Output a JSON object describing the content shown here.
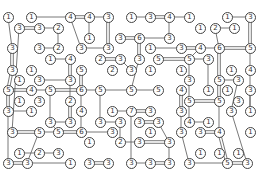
{
  "game": {
    "title": "Hashi (Bridges) puzzle",
    "colors": {
      "background": "#ffffff",
      "bridge": "#555555",
      "island_border": "#444444",
      "text": "#333333"
    },
    "islands": [
      {
        "id": "a1",
        "x": 8,
        "y": 17,
        "n": 1
      },
      {
        "id": "a2",
        "x": 31,
        "y": 17,
        "n": 1
      },
      {
        "id": "a3",
        "x": 70,
        "y": 17,
        "n": 4
      },
      {
        "id": "a4",
        "x": 89,
        "y": 17,
        "n": 4
      },
      {
        "id": "a5",
        "x": 108,
        "y": 17,
        "n": 3
      },
      {
        "id": "a6",
        "x": 131,
        "y": 17,
        "n": 1
      },
      {
        "id": "a7",
        "x": 150,
        "y": 17,
        "n": 3
      },
      {
        "id": "a8",
        "x": 169,
        "y": 17,
        "n": 4
      },
      {
        "id": "a9",
        "x": 189,
        "y": 17,
        "n": 1
      },
      {
        "id": "a10",
        "x": 227,
        "y": 17,
        "n": 1
      },
      {
        "id": "a11",
        "x": 250,
        "y": 17,
        "n": 3
      },
      {
        "id": "b1",
        "x": 19,
        "y": 28,
        "n": 3
      },
      {
        "id": "b2",
        "x": 39,
        "y": 28,
        "n": 3
      },
      {
        "id": "b3",
        "x": 58,
        "y": 28,
        "n": 2
      },
      {
        "id": "b4",
        "x": 200,
        "y": 28,
        "n": 1
      },
      {
        "id": "b5",
        "x": 215,
        "y": 28,
        "n": 2
      },
      {
        "id": "b6",
        "x": 234,
        "y": 28,
        "n": 1
      },
      {
        "id": "c1",
        "x": 89,
        "y": 38,
        "n": 1
      },
      {
        "id": "c2",
        "x": 120,
        "y": 38,
        "n": 3
      },
      {
        "id": "c3",
        "x": 139,
        "y": 38,
        "n": 6
      },
      {
        "id": "c4",
        "x": 169,
        "y": 38,
        "n": 3
      },
      {
        "id": "d1",
        "x": 12,
        "y": 48,
        "n": 3
      },
      {
        "id": "d2",
        "x": 39,
        "y": 48,
        "n": 3
      },
      {
        "id": "d3",
        "x": 58,
        "y": 48,
        "n": 2
      },
      {
        "id": "d4",
        "x": 81,
        "y": 48,
        "n": 3
      },
      {
        "id": "d5",
        "x": 108,
        "y": 48,
        "n": 3
      },
      {
        "id": "d6",
        "x": 150,
        "y": 48,
        "n": 1
      },
      {
        "id": "d7",
        "x": 181,
        "y": 48,
        "n": 3
      },
      {
        "id": "d8",
        "x": 200,
        "y": 48,
        "n": 4
      },
      {
        "id": "d9",
        "x": 219,
        "y": 48,
        "n": 6
      },
      {
        "id": "d10",
        "x": 250,
        "y": 48,
        "n": 5
      },
      {
        "id": "e1",
        "x": 50,
        "y": 59,
        "n": 1
      },
      {
        "id": "e2",
        "x": 70,
        "y": 59,
        "n": 4
      },
      {
        "id": "e3",
        "x": 100,
        "y": 59,
        "n": 2
      },
      {
        "id": "e4",
        "x": 120,
        "y": 59,
        "n": 3
      },
      {
        "id": "e5",
        "x": 139,
        "y": 59,
        "n": 3
      },
      {
        "id": "e6",
        "x": 158,
        "y": 59,
        "n": 5
      },
      {
        "id": "e7",
        "x": 189,
        "y": 59,
        "n": 5
      },
      {
        "id": "e8",
        "x": 208,
        "y": 59,
        "n": 3
      },
      {
        "id": "f1",
        "x": 12,
        "y": 70,
        "n": 3
      },
      {
        "id": "f2",
        "x": 31,
        "y": 70,
        "n": 1
      },
      {
        "id": "f3",
        "x": 81,
        "y": 70,
        "n": 5
      },
      {
        "id": "f4",
        "x": 112,
        "y": 70,
        "n": 2
      },
      {
        "id": "f5",
        "x": 131,
        "y": 70,
        "n": 3
      },
      {
        "id": "f6",
        "x": 150,
        "y": 70,
        "n": 1
      },
      {
        "id": "f7",
        "x": 181,
        "y": 70,
        "n": 1
      },
      {
        "id": "f8",
        "x": 231,
        "y": 70,
        "n": 1
      },
      {
        "id": "f9",
        "x": 250,
        "y": 70,
        "n": 4
      },
      {
        "id": "g1",
        "x": 19,
        "y": 80,
        "n": 1
      },
      {
        "id": "g2",
        "x": 39,
        "y": 80,
        "n": 3
      },
      {
        "id": "g3",
        "x": 70,
        "y": 80,
        "n": 3
      },
      {
        "id": "g4",
        "x": 189,
        "y": 80,
        "n": 3
      },
      {
        "id": "g5",
        "x": 219,
        "y": 80,
        "n": 5
      },
      {
        "id": "g6",
        "x": 238,
        "y": 80,
        "n": 3
      },
      {
        "id": "h1",
        "x": 8,
        "y": 90,
        "n": 5
      },
      {
        "id": "h2",
        "x": 31,
        "y": 90,
        "n": 4
      },
      {
        "id": "h3",
        "x": 50,
        "y": 90,
        "n": 5
      },
      {
        "id": "h4",
        "x": 81,
        "y": 90,
        "n": 6
      },
      {
        "id": "h5",
        "x": 100,
        "y": 90,
        "n": 5
      },
      {
        "id": "h6",
        "x": 131,
        "y": 90,
        "n": 5
      },
      {
        "id": "h7",
        "x": 158,
        "y": 90,
        "n": 5
      },
      {
        "id": "h8",
        "x": 181,
        "y": 90,
        "n": 4
      },
      {
        "id": "h9",
        "x": 208,
        "y": 90,
        "n": 1
      },
      {
        "id": "h10",
        "x": 227,
        "y": 90,
        "n": 1
      },
      {
        "id": "h11",
        "x": 250,
        "y": 90,
        "n": 3
      },
      {
        "id": "i1",
        "x": 19,
        "y": 101,
        "n": 1
      },
      {
        "id": "i2",
        "x": 39,
        "y": 101,
        "n": 3
      },
      {
        "id": "i3",
        "x": 70,
        "y": 101,
        "n": 2
      },
      {
        "id": "i4",
        "x": 189,
        "y": 101,
        "n": 5
      },
      {
        "id": "i5",
        "x": 219,
        "y": 101,
        "n": 5
      },
      {
        "id": "i6",
        "x": 238,
        "y": 101,
        "n": 3
      },
      {
        "id": "j1",
        "x": 8,
        "y": 111,
        "n": 3
      },
      {
        "id": "j2",
        "x": 31,
        "y": 111,
        "n": 1
      },
      {
        "id": "j3",
        "x": 81,
        "y": 111,
        "n": 4
      },
      {
        "id": "j4",
        "x": 112,
        "y": 111,
        "n": 1
      },
      {
        "id": "j5",
        "x": 131,
        "y": 111,
        "n": 7
      },
      {
        "id": "j6",
        "x": 150,
        "y": 111,
        "n": 3
      },
      {
        "id": "j7",
        "x": 181,
        "y": 111,
        "n": 3
      },
      {
        "id": "j8",
        "x": 231,
        "y": 111,
        "n": 3
      },
      {
        "id": "j9",
        "x": 250,
        "y": 111,
        "n": 1
      },
      {
        "id": "k1",
        "x": 50,
        "y": 122,
        "n": 3
      },
      {
        "id": "k2",
        "x": 70,
        "y": 122,
        "n": 3
      },
      {
        "id": "k3",
        "x": 100,
        "y": 122,
        "n": 3
      },
      {
        "id": "k4",
        "x": 120,
        "y": 122,
        "n": 3
      },
      {
        "id": "k5",
        "x": 139,
        "y": 122,
        "n": 3
      },
      {
        "id": "k6",
        "x": 158,
        "y": 122,
        "n": 3
      },
      {
        "id": "k7",
        "x": 189,
        "y": 122,
        "n": 4
      },
      {
        "id": "k8",
        "x": 208,
        "y": 122,
        "n": 1
      },
      {
        "id": "l1",
        "x": 12,
        "y": 132,
        "n": 3
      },
      {
        "id": "l2",
        "x": 39,
        "y": 132,
        "n": 5
      },
      {
        "id": "l3",
        "x": 58,
        "y": 132,
        "n": 5
      },
      {
        "id": "l4",
        "x": 81,
        "y": 132,
        "n": 6
      },
      {
        "id": "l5",
        "x": 112,
        "y": 132,
        "n": 3
      },
      {
        "id": "l6",
        "x": 150,
        "y": 132,
        "n": 1
      },
      {
        "id": "l7",
        "x": 181,
        "y": 132,
        "n": 3
      },
      {
        "id": "l8",
        "x": 200,
        "y": 132,
        "n": 3
      },
      {
        "id": "l9",
        "x": 219,
        "y": 132,
        "n": 4
      },
      {
        "id": "l10",
        "x": 250,
        "y": 132,
        "n": 1
      },
      {
        "id": "m1",
        "x": 89,
        "y": 142,
        "n": 1
      },
      {
        "id": "m2",
        "x": 120,
        "y": 142,
        "n": 2
      },
      {
        "id": "m3",
        "x": 139,
        "y": 142,
        "n": 3
      },
      {
        "id": "m4",
        "x": 169,
        "y": 142,
        "n": 3
      },
      {
        "id": "n1",
        "x": 19,
        "y": 153,
        "n": 1
      },
      {
        "id": "n2",
        "x": 39,
        "y": 153,
        "n": 2
      },
      {
        "id": "n3",
        "x": 58,
        "y": 153,
        "n": 3
      },
      {
        "id": "n4",
        "x": 200,
        "y": 153,
        "n": 1
      },
      {
        "id": "n5",
        "x": 219,
        "y": 153,
        "n": 1
      },
      {
        "id": "n6",
        "x": 238,
        "y": 153,
        "n": 1
      },
      {
        "id": "o1",
        "x": 8,
        "y": 163,
        "n": 3
      },
      {
        "id": "o2",
        "x": 27,
        "y": 163,
        "n": 3
      },
      {
        "id": "o3",
        "x": 70,
        "y": 163,
        "n": 1
      },
      {
        "id": "o4",
        "x": 89,
        "y": 163,
        "n": 3
      },
      {
        "id": "o5",
        "x": 108,
        "y": 163,
        "n": 3
      },
      {
        "id": "o6",
        "x": 131,
        "y": 163,
        "n": 3
      },
      {
        "id": "o7",
        "x": 150,
        "y": 163,
        "n": 3
      },
      {
        "id": "o8",
        "x": 169,
        "y": 163,
        "n": 3
      },
      {
        "id": "o9",
        "x": 189,
        "y": 163,
        "n": 3
      },
      {
        "id": "o10",
        "x": 227,
        "y": 163,
        "n": 5
      },
      {
        "id": "o11",
        "x": 247,
        "y": 163,
        "n": 3
      }
    ],
    "bridges": [
      [
        "a2",
        "a3",
        1
      ],
      [
        "a3",
        "a4",
        2
      ],
      [
        "a4",
        "a5",
        1
      ],
      [
        "a6",
        "a7",
        1
      ],
      [
        "a7",
        "a8",
        2
      ],
      [
        "a8",
        "a9",
        1
      ],
      [
        "a10",
        "a11",
        1
      ],
      [
        "b1",
        "b2",
        2
      ],
      [
        "b2",
        "b3",
        1
      ],
      [
        "b5",
        "b6",
        1
      ],
      [
        "c2",
        "c3",
        2
      ],
      [
        "c3",
        "c4",
        1
      ],
      [
        "d2",
        "d3",
        1
      ],
      [
        "d4",
        "d5",
        1
      ],
      [
        "d6",
        "d7",
        1
      ],
      [
        "d7",
        "d8",
        2
      ],
      [
        "d8",
        "d9",
        1
      ],
      [
        "d9",
        "d10",
        2
      ],
      [
        "e1",
        "e2",
        1
      ],
      [
        "e3",
        "e4",
        2
      ],
      [
        "e6",
        "e7",
        2
      ],
      [
        "e7",
        "e8",
        1
      ],
      [
        "g2",
        "g3",
        1
      ],
      [
        "g5",
        "g6",
        1
      ],
      [
        "h1",
        "h2",
        2
      ],
      [
        "h2",
        "h3",
        1
      ],
      [
        "h3",
        "h4",
        2
      ],
      [
        "h4",
        "h5",
        1
      ],
      [
        "h5",
        "h6",
        1
      ],
      [
        "h6",
        "h7",
        1
      ],
      [
        "i4",
        "i5",
        2
      ],
      [
        "j2",
        "j1",
        1
      ],
      [
        "j4",
        "j5",
        1
      ],
      [
        "j5",
        "j6",
        2
      ],
      [
        "k1",
        "k2",
        1
      ],
      [
        "k3",
        "k4",
        1
      ],
      [
        "k5",
        "k6",
        2
      ],
      [
        "k7",
        "k8",
        1
      ],
      [
        "l1",
        "l2",
        2
      ],
      [
        "l2",
        "l3",
        1
      ],
      [
        "l3",
        "l4",
        2
      ],
      [
        "l4",
        "l5",
        1
      ],
      [
        "l8",
        "l9",
        2
      ],
      [
        "m2",
        "m3",
        1
      ],
      [
        "m3",
        "m4",
        2
      ],
      [
        "n1",
        "n2",
        1
      ],
      [
        "n2",
        "n3",
        1
      ],
      [
        "o1",
        "o2",
        2
      ],
      [
        "o2",
        "o3",
        1
      ],
      [
        "o4",
        "o5",
        2
      ],
      [
        "o6",
        "o7",
        1
      ],
      [
        "o7",
        "o8",
        2
      ],
      [
        "o9",
        "o10",
        1
      ],
      [
        "o10",
        "o11",
        2
      ],
      [
        "a1",
        "d1",
        1
      ],
      [
        "d1",
        "f1",
        2
      ],
      [
        "f1",
        "h1",
        2
      ],
      [
        "h1",
        "j1",
        2
      ],
      [
        "j1",
        "o1",
        1
      ],
      [
        "a3",
        "d4",
        1
      ],
      [
        "a4",
        "c1",
        1
      ],
      [
        "a5",
        "d5",
        2
      ],
      [
        "b3",
        "d3",
        1
      ],
      [
        "b1",
        "l1",
        1
      ],
      [
        "c3",
        "e5",
        2
      ],
      [
        "e5",
        "h6",
        1
      ],
      [
        "e4",
        "f5",
        1
      ],
      [
        "a8",
        "c4",
        1
      ],
      [
        "d8",
        "e7",
        1
      ],
      [
        "b5",
        "d9",
        1
      ],
      [
        "a11",
        "d10",
        2
      ],
      [
        "d10",
        "f9",
        1
      ],
      [
        "f9",
        "j9",
        1
      ],
      [
        "e7",
        "g4",
        1
      ],
      [
        "g4",
        "i4",
        1
      ],
      [
        "i4",
        "k7",
        1
      ],
      [
        "e8",
        "h9",
        1
      ],
      [
        "d9",
        "g5",
        2
      ],
      [
        "g5",
        "i5",
        2
      ],
      [
        "i5",
        "l9",
        1
      ],
      [
        "l9",
        "o10",
        2
      ],
      [
        "h11",
        "j9",
        1
      ],
      [
        "g6",
        "j8",
        1
      ],
      [
        "j8",
        "o11",
        1
      ],
      [
        "e2",
        "g3",
        2
      ],
      [
        "g3",
        "i3",
        1
      ],
      [
        "i3",
        "k2",
        2
      ],
      [
        "f3",
        "h4",
        2
      ],
      [
        "h4",
        "j3",
        1
      ],
      [
        "j3",
        "l4",
        1
      ],
      [
        "h5",
        "k3",
        1
      ],
      [
        "h3",
        "k1",
        1
      ],
      [
        "k1",
        "l3",
        1
      ],
      [
        "l2",
        "o2",
        1
      ],
      [
        "k4",
        "m2",
        1
      ],
      [
        "j5",
        "o6",
        1
      ],
      [
        "k6",
        "m4",
        1
      ],
      [
        "m4",
        "o8",
        1
      ],
      [
        "l7",
        "o9",
        1
      ],
      [
        "j7",
        "l7",
        1
      ],
      [
        "h8",
        "j7",
        2
      ]
    ]
  }
}
